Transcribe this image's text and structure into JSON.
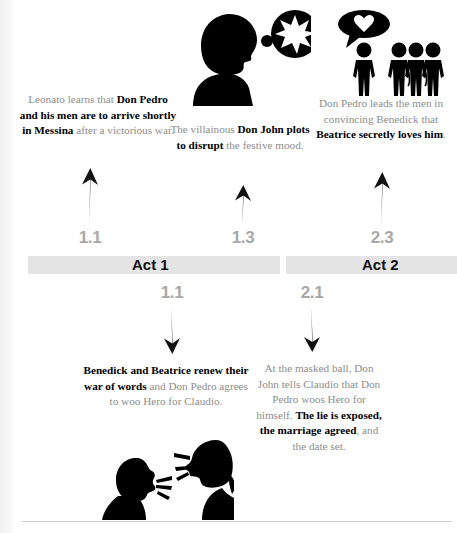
{
  "timeline": {
    "acts": [
      {
        "label": "Act 1"
      },
      {
        "label": "Act 2"
      }
    ],
    "scene_markers_above": [
      "1.1",
      "1.3",
      "2.3"
    ],
    "scene_markers_below": [
      "1.1",
      "2.1"
    ]
  },
  "colors": {
    "body_text": "#8d8d8d",
    "emphasis_text": "#000000",
    "scene_number": "#a8a8a8",
    "act_bar": "#e4e4e4",
    "act_label": "#111111",
    "rule": "#c9c9c9"
  },
  "events": {
    "leonato": {
      "scene": "1.1",
      "parts": [
        {
          "text": "Leonato learns that ",
          "bold": false
        },
        {
          "text": "Don Pedro and his men are to arrive shortly in Messina",
          "bold": true
        },
        {
          "text": " after a victorious war.",
          "bold": false
        }
      ]
    },
    "don_john": {
      "scene": "1.3",
      "parts": [
        {
          "text": "The villainous ",
          "bold": false
        },
        {
          "text": "Don John plots to disrupt",
          "bold": true
        },
        {
          "text": " the festive mood.",
          "bold": false
        }
      ]
    },
    "beatrice_trick": {
      "scene": "2.3",
      "parts": [
        {
          "text": "Don Pedro leads the men in convincing Benedick that ",
          "bold": false
        },
        {
          "text": "Beatrice secretly loves him",
          "bold": true
        },
        {
          "text": ".",
          "bold": false
        }
      ]
    },
    "benedick_beatrice": {
      "scene": "1.1",
      "parts": [
        {
          "text": "Benedick and Beatrice renew their war of words",
          "bold": true
        },
        {
          "text": " and Don Pedro agrees to woo Hero for Claudio.",
          "bold": false
        }
      ]
    },
    "masked_ball": {
      "scene": "2.1",
      "parts": [
        {
          "text": "At the masked ball, Don John tells Claudio that Don Pedro woos Hero for himself. ",
          "bold": false
        },
        {
          "text": "The lie is exposed, the marriage agreed",
          "bold": true
        },
        {
          "text": ", and the date set.",
          "bold": false
        }
      ]
    }
  },
  "illustrations": [
    {
      "name": "thinking-head-with-starburst-thought-icon",
      "scene": "1.3"
    },
    {
      "name": "figure-with-heart-bubble-and-group-icon",
      "scene": "2.3"
    },
    {
      "name": "two-heads-arguing-icon",
      "scene": "1.1"
    }
  ]
}
